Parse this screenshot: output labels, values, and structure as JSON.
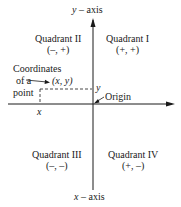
{
  "axes": {
    "y_label_var": "y",
    "y_label_text": "– axis",
    "x_label_var": "x",
    "x_label_text": "– axis"
  },
  "quadrants": [
    {
      "name": "Quadrant I",
      "signs": "(+, +)"
    },
    {
      "name": "Quadrant II",
      "signs": "(–, +)"
    },
    {
      "name": "Quadrant III",
      "signs": "(–, –)"
    },
    {
      "name": "Quadrant IV",
      "signs": "(+, –)"
    }
  ],
  "point": {
    "caption_line1": "Coordinates",
    "caption_line2": "of a",
    "caption_line3": "point",
    "coords": "(x, y)",
    "x_tick": "x",
    "y_tick": "y"
  },
  "origin_label": "Origin"
}
